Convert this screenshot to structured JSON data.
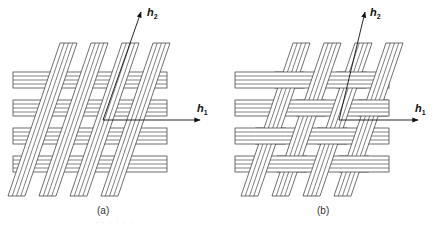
{
  "figure": {
    "panels": [
      {
        "id": "a",
        "caption": "(a)",
        "type": "non-woven overlay"
      },
      {
        "id": "b",
        "caption": "(b)",
        "type": "woven interlace"
      }
    ],
    "vectors": {
      "h1": {
        "symbol": "h",
        "subscript": "1"
      },
      "h2": {
        "symbol": "h",
        "subscript": "2"
      }
    },
    "strip_lines_per_strip": 4,
    "horizontal_strip_count": 4,
    "diagonal_strip_count": 4,
    "colors": {
      "line": "#4a4a4a",
      "fill": "#ffffff",
      "text": "#111111"
    },
    "footer_faint_text": "· · · · · ·"
  }
}
